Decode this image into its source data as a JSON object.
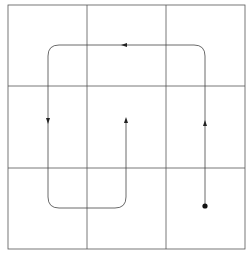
{
  "diagram": {
    "type": "path-on-grid",
    "grid": {
      "rows": 3,
      "cols": 3,
      "x_lines": [
        8,
        87,
        166,
        245
      ],
      "y_lines": [
        5,
        86,
        168,
        249
      ],
      "stroke_color": "#555555"
    },
    "path": {
      "stroke_color": "#444444",
      "start_marker": "filled-dot",
      "start_point": [
        205,
        206
      ],
      "corner_radius": 11,
      "segments": [
        {
          "from": [
            205,
            206
          ],
          "to": [
            205,
            45
          ],
          "direction": "up"
        },
        {
          "from": [
            205,
            45
          ],
          "to": [
            48,
            45
          ],
          "direction": "left"
        },
        {
          "from": [
            48,
            45
          ],
          "to": [
            48,
            208
          ],
          "direction": "down"
        },
        {
          "from": [
            48,
            208
          ],
          "to": [
            126,
            208
          ],
          "direction": "right"
        },
        {
          "from": [
            126,
            208
          ],
          "to": [
            126,
            121
          ],
          "direction": "up"
        }
      ],
      "arrowheads": [
        {
          "at": [
            205,
            124
          ],
          "direction": "up"
        },
        {
          "at": [
            125,
            45
          ],
          "direction": "left"
        },
        {
          "at": [
            48,
            121
          ],
          "direction": "down"
        },
        {
          "at": [
            126,
            121
          ],
          "direction": "up"
        }
      ]
    },
    "caption": ""
  }
}
